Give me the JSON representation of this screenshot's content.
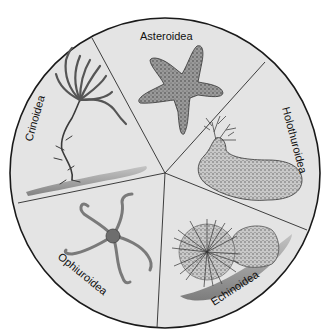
{
  "diagram": {
    "type": "pie-style classification wheel",
    "center": [
      165,
      173
    ],
    "radius": 155,
    "colors": {
      "background": "#ffffff",
      "wheel_fill": "#e4e4e4",
      "outline": "#1a1a1a",
      "illustration": "#5a5a5a"
    },
    "segments": [
      {
        "id": "asteroidea",
        "label": "Asteroidea",
        "illustration": "sea-star"
      },
      {
        "id": "holothuroidea",
        "label": "Holothuroidea",
        "illustration": "sea-cucumber"
      },
      {
        "id": "echinoidea",
        "label": "Echinoidea",
        "illustration": "sea-urchin"
      },
      {
        "id": "ophiuroidea",
        "label": "Ophiuroidea",
        "illustration": "brittle-star"
      },
      {
        "id": "crinoidea",
        "label": "Crinoidea",
        "illustration": "sea-lily"
      }
    ]
  }
}
